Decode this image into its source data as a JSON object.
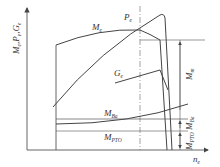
{
  "diagram": {
    "y_axis_label": {
      "main": "M",
      "parts": [
        {
          "base": "M",
          "sub": "e"
        },
        {
          "base": "P",
          "sub": "e"
        },
        {
          "base": "G",
          "sub": "e"
        }
      ]
    },
    "x_axis_label": {
      "base": "n",
      "sub": "e"
    },
    "curves": [
      {
        "id": "torque",
        "base": "M",
        "sub": "e"
      },
      {
        "id": "power",
        "base": "P",
        "sub": "e"
      },
      {
        "id": "fuel",
        "base": "G",
        "sub": "e"
      },
      {
        "id": "aux",
        "base": "M",
        "sub": "Ba"
      },
      {
        "id": "pto",
        "base": "M",
        "sub": "PTO"
      }
    ],
    "dimensions": [
      {
        "id": "reserve",
        "base": "M",
        "sub": "m"
      },
      {
        "id": "ba",
        "base": "M",
        "sub": "Ba"
      },
      {
        "id": "pto",
        "base": "M",
        "sub": "PTO"
      }
    ],
    "colors": {
      "line": "#444444",
      "axis": "#555555",
      "background": "#ffffff"
    }
  }
}
